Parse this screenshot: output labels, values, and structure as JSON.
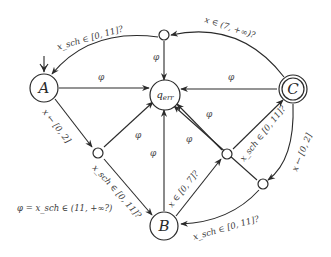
{
  "diagram": {
    "type": "automaton",
    "nodes": {
      "A": {
        "label": "A",
        "initial": true,
        "accepting": false
      },
      "q_err": {
        "label": "q",
        "sub": "err"
      },
      "C": {
        "label": "C",
        "accepting": true
      },
      "B": {
        "label": "B"
      },
      "T1": {
        "label": ""
      },
      "M1": {
        "label": ""
      },
      "M2": {
        "label": ""
      },
      "M3": {
        "label": ""
      }
    },
    "edges": {
      "t1_to_a": "x_sch ∈ [0, 11]?",
      "c_to_t1": "x ∈ (7, +∞)?",
      "a_to_m1": "x ← [0, 2]",
      "m1_to_b": "x_sch ∈ [0, 11]?",
      "b_to_m2": "x ∈ [0, 7]?",
      "m2_to_c": "x_sch ∈ [0, 11]?",
      "c_to_m3": "x ← [0, 2]",
      "m3_to_b": "x_sch ∈ [0, 11]?",
      "phi": "φ"
    },
    "legend": "φ = x_sch ∈ (11, +∞?)"
  }
}
